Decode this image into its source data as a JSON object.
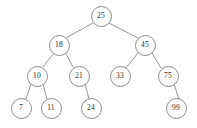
{
  "figure": {
    "kind": "binary-search-tree-diagram",
    "background_color": "#ffffff",
    "node_stroke_color": "#8a8a8a",
    "edge_stroke_color": "#8a8a8a",
    "text_color": "#2b2b2b"
  },
  "tree": {
    "nodes": [
      {
        "id": "n25",
        "label": "25",
        "cx": 101,
        "cy": 16,
        "r": 10.5,
        "font_size": 7.5
      },
      {
        "id": "n18",
        "label": "18",
        "cx": 59,
        "cy": 45,
        "r": 10.5,
        "font_size": 7.5
      },
      {
        "id": "n45",
        "label": "45",
        "cx": 145,
        "cy": 45,
        "r": 10.5,
        "font_size": 7.5
      },
      {
        "id": "n10",
        "label": "10",
        "cx": 37,
        "cy": 76,
        "r": 10.5,
        "font_size": 7.5
      },
      {
        "id": "n21",
        "label": "21",
        "cx": 79,
        "cy": 76,
        "r": 10.5,
        "font_size": 7.5
      },
      {
        "id": "n33",
        "label": "33",
        "cx": 120,
        "cy": 76,
        "r": 10.5,
        "font_size": 7.5
      },
      {
        "id": "n75",
        "label": "75",
        "cx": 168,
        "cy": 76,
        "r": 10.5,
        "font_size": 7.5
      },
      {
        "id": "n7",
        "label": "7",
        "cx": 21,
        "cy": 108,
        "r": 10.5,
        "font_size": 7.5
      },
      {
        "id": "n11",
        "label": "11",
        "cx": 51,
        "cy": 108,
        "r": 10.5,
        "font_size": 7.5
      },
      {
        "id": "n24",
        "label": "24",
        "cx": 91,
        "cy": 108,
        "r": 10.5,
        "font_size": 7.5
      },
      {
        "id": "n99",
        "label": "99",
        "cx": 176,
        "cy": 108,
        "r": 10.5,
        "font_size": 7.5
      }
    ],
    "edges": [
      {
        "from": "n25",
        "to": "n18",
        "x1": 93,
        "y1": 23,
        "x2": 66,
        "y2": 38
      },
      {
        "from": "n25",
        "to": "n45",
        "x1": 109,
        "y1": 23,
        "x2": 138,
        "y2": 38
      },
      {
        "from": "n18",
        "to": "n10",
        "x1": 53,
        "y1": 54,
        "x2": 43,
        "y2": 67
      },
      {
        "from": "n18",
        "to": "n21",
        "x1": 66,
        "y1": 54,
        "x2": 73,
        "y2": 67
      },
      {
        "from": "n45",
        "to": "n33",
        "x1": 138,
        "y1": 53,
        "x2": 126,
        "y2": 68
      },
      {
        "from": "n45",
        "to": "n75",
        "x1": 152,
        "y1": 53,
        "x2": 161,
        "y2": 68
      },
      {
        "from": "n10",
        "to": "n7",
        "x1": 31,
        "y1": 84,
        "x2": 26,
        "y2": 99
      },
      {
        "from": "n10",
        "to": "n11",
        "x1": 43,
        "y1": 84,
        "x2": 47,
        "y2": 99
      },
      {
        "from": "n21",
        "to": "n24",
        "x1": 85,
        "y1": 84,
        "x2": 89,
        "y2": 99
      },
      {
        "from": "n75",
        "to": "n99",
        "x1": 174,
        "y1": 84,
        "x2": 179,
        "y2": 99
      }
    ]
  }
}
